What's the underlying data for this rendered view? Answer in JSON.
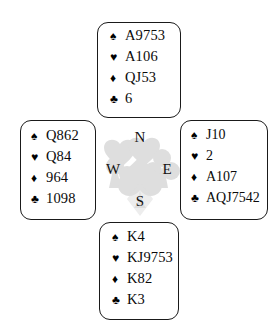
{
  "diagram": {
    "type": "bridge-deal",
    "suit_glyphs": {
      "spade": "♠",
      "heart": "♥",
      "diamond": "♦",
      "club": "♣"
    },
    "suit_color": "#000000",
    "background_color": "#ffffff",
    "border_color": "#1a1a1a",
    "watermark_color": "#d9d9d9"
  },
  "compass": {
    "north": "N",
    "west": "W",
    "east": "E",
    "south": "S"
  },
  "hands": {
    "north": {
      "label": "North",
      "spades": "A9753",
      "hearts": "A106",
      "diamonds": "QJ53",
      "clubs": "6"
    },
    "west": {
      "label": "West",
      "spades": "Q862",
      "hearts": "Q84",
      "diamonds": "964",
      "clubs": "1098"
    },
    "east": {
      "label": "East",
      "spades": "J10",
      "hearts": "2",
      "diamonds": "A107",
      "clubs": "AQJ7542"
    },
    "south": {
      "label": "South",
      "spades": "K4",
      "hearts": "KJ9753",
      "diamonds": "K82",
      "clubs": "K3"
    }
  }
}
